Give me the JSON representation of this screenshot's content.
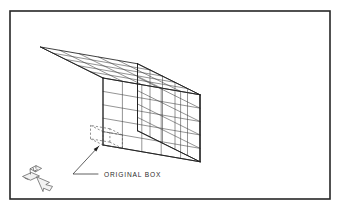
{
  "figure": {
    "kind": "isometric-wireframe-diagram",
    "background_color": "#ffffff",
    "line_color": "#3a3a3a",
    "edge_color": "#1f1f1f",
    "dashed_color": "#4a4a4a",
    "border_color": "#262626"
  },
  "border": {
    "x": 10,
    "y": 11,
    "width": 320,
    "height": 188
  },
  "callout": {
    "label": "ORIGINAL BOX",
    "leader_arrow_tip_x": 99,
    "leader_arrow_tip_y": 146,
    "leader_elbow_x": 73,
    "leader_elbow_y": 174,
    "leader_end_x": 98,
    "leader_end_y": 174
  },
  "logo": {
    "name": "isometric-arrow-logo",
    "x": 14,
    "y": 162,
    "width": 44,
    "height": 32
  },
  "box_array": {
    "divisions_x": 5,
    "divisions_y": 5,
    "divisions_z": 5,
    "total_cells": 125,
    "origin_cell_index": [
      0,
      0,
      0
    ],
    "origin_cell_style": "dashed",
    "projection": "isometric",
    "anchor": {
      "front_bottom_x": 103,
      "front_bottom_y": 145
    },
    "axis_u": {
      "dx": 19.4,
      "dy": 3.35,
      "label": "width-right"
    },
    "axis_v": {
      "dx": -12.5,
      "dy": -6.2,
      "label": "depth-back"
    },
    "axis_w": {
      "dx": 0,
      "dy": -13.4,
      "label": "height-up"
    }
  },
  "chart_data": {
    "type": "table",
    "title": "ORIGINAL BOX",
    "categories": [
      "divisions_x",
      "divisions_y",
      "divisions_z",
      "total_cells"
    ],
    "values": [
      5,
      5,
      5,
      125
    ]
  }
}
